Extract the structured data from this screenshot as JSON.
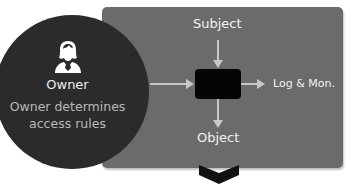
{
  "diagram": {
    "owner": {
      "icon": "person-female-icon",
      "label": "Owner",
      "description_line1": "Owner determines",
      "description_line2": "access rules"
    },
    "nodes": {
      "subject": "Subject",
      "object": "Object",
      "log": "Log & Mon."
    },
    "colors": {
      "panel": "#6b6b6b",
      "circle": "#2b2b2b",
      "engine": "#050505",
      "arrow": "#c8c8c8"
    },
    "footer_icon": "chevron-down-icon"
  }
}
